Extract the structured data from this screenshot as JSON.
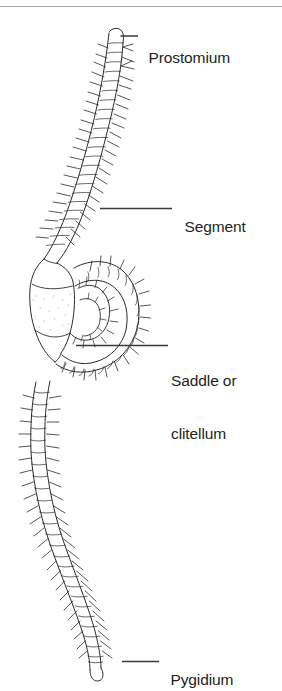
{
  "figure": {
    "style": "black-and-white line drawing",
    "background_color": "#ffffff",
    "line_color": "#231f20",
    "rule_color": "#a8a8ac",
    "top_rule": true
  },
  "labels": [
    {
      "id": "prostomium",
      "text": "Prostomium",
      "lines": [
        "Prostomium"
      ],
      "leader": true
    },
    {
      "id": "segment",
      "text": "Segment",
      "lines": [
        "Segment"
      ],
      "leader": true
    },
    {
      "id": "saddle",
      "text": "Saddle or clitellum",
      "lines": [
        "Saddle or",
        "clitellum"
      ],
      "leader": true
    },
    {
      "id": "pygidium",
      "text": "Pygidium",
      "lines": [
        "Pygidium"
      ],
      "leader": true
    }
  ],
  "label_text": {
    "prostomium": "Prostomium",
    "segment": "Segment",
    "saddle_line1": "Saddle or",
    "saddle_line2": "clitellum",
    "pygidium": "Pygidium"
  }
}
